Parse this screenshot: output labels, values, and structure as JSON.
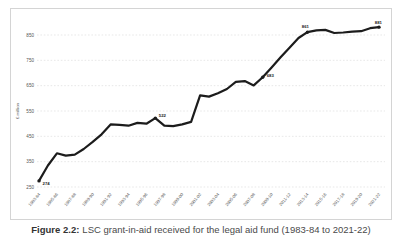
{
  "figure_caption": {
    "prefix": "Figure 2.2:",
    "text": "LSC grant-in-aid received for the legal aid fund (1983-84 to 2021-22)"
  },
  "chart_data": {
    "type": "line",
    "title": "",
    "xlabel": "",
    "ylabel": "£ million",
    "ylim": [
      250,
      900
    ],
    "y_ticks": [
      250,
      350,
      450,
      550,
      650,
      750,
      850
    ],
    "grid": "horizontal-dashed",
    "legend": "none",
    "line_color": "#1c1c1c",
    "grid_color": "#d9d9d9",
    "axis_text_color": "#555555",
    "x": [
      "1983-84",
      "1984-85",
      "1985-86",
      "1986-87",
      "1987-88",
      "1988-89",
      "1989-90",
      "1990-91",
      "1991-92",
      "1992-93",
      "1993-94",
      "1994-95",
      "1995-96",
      "1996-97",
      "1997-98",
      "1998-99",
      "1999-00",
      "2000-01",
      "2001-02",
      "2002-03",
      "2003-04",
      "2004-05",
      "2005-06",
      "2006-07",
      "2007-08",
      "2008-09",
      "2009-10",
      "2010-11",
      "2011-12",
      "2012-13",
      "2013-14",
      "2014-15",
      "2015-16",
      "2016-17",
      "2017-18",
      "2018-19",
      "2019-20",
      "2020-21",
      "2021-22"
    ],
    "x_tick_labels": [
      "1983-84",
      "1985-86",
      "1987-88",
      "1989-90",
      "1991-92",
      "1993-94",
      "1995-96",
      "1997-98",
      "1999-00",
      "2001-02",
      "2003-04",
      "2005-06",
      "2007-08",
      "2009-10",
      "2011-12",
      "2013-14",
      "2015-16",
      "2017-18",
      "2019-20",
      "2021-22"
    ],
    "series": [
      {
        "name": "Grant-in-aid (£ million)",
        "values": [
          274,
          335,
          383,
          374,
          378,
          400,
          428,
          458,
          497,
          495,
          492,
          503,
          500,
          522,
          492,
          490,
          497,
          507,
          612,
          607,
          620,
          637,
          665,
          668,
          651,
          683,
          722,
          762,
          800,
          838,
          861,
          868,
          870,
          858,
          860,
          863,
          865,
          877,
          881
        ]
      }
    ],
    "annotations": [
      {
        "x": "1983-84",
        "value": 274,
        "label": "274",
        "dx": 3.5,
        "dy": 4.5,
        "anchor": "start"
      },
      {
        "x": "1996-97",
        "value": 522,
        "label": "522",
        "dx": 3.5,
        "dy": -1.5,
        "anchor": "start"
      },
      {
        "x": "2008-09",
        "value": 683,
        "label": "683",
        "dx": 4,
        "dy": -0.5,
        "anchor": "start"
      },
      {
        "x": "2013-14",
        "value": 861,
        "label": "861",
        "dx": -2,
        "dy": -4,
        "anchor": "middle"
      },
      {
        "x": "2021-22",
        "value": 881,
        "label": "881",
        "dx": 3,
        "dy": -3.5,
        "anchor": "end"
      }
    ]
  }
}
